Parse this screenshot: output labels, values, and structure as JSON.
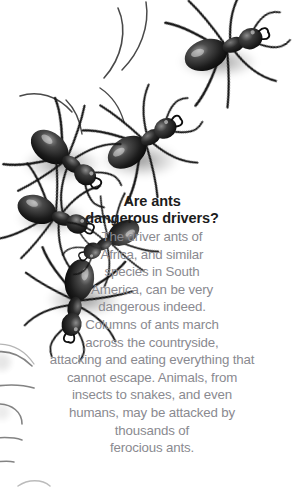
{
  "page": {
    "background_color": "#ffffff",
    "width": 301,
    "height": 501
  },
  "article": {
    "headline_color": "#1c1c1c",
    "body_color": "#8a8a90",
    "headline_lines": [
      "Are ants",
      "dangerous drivers?"
    ],
    "headline_full": "Are ants dangerous drivers?",
    "body_lines": [
      "The driver ants of",
      "Africa, and similar",
      "species in South",
      "America, can be very",
      "dangerous indeed.",
      "Columns of ants march",
      "across the countryside,",
      "attacking and eating everything that",
      "cannot escape. Animals, from",
      "insects to snakes, and even",
      "humans, may be attacked by",
      "thousands of",
      "ferocious ants."
    ],
    "body_full": "The driver ants of Africa, and similar species in South America, can be very dangerous indeed. Columns of ants march across the countryside, attacking and eating everything that cannot escape. Animals, from insects to snakes, and even humans, may be attacked by thousands of ferocious ants."
  },
  "illustration": {
    "subject": "black driver ants",
    "ant_body_color": "#141414",
    "ant_highlight_color": "#d8d8d8",
    "shadow_color": "#b4b4b4",
    "ants": [
      {
        "id": "ant-top-right",
        "cx": 214,
        "cy": 52,
        "scale": 1.05,
        "rotate": -20
      },
      {
        "id": "ant-upper-left",
        "cx": 56,
        "cy": 152,
        "scale": 1.0,
        "rotate": 38
      },
      {
        "id": "ant-upper-right",
        "cx": 134,
        "cy": 148,
        "scale": 1.0,
        "rotate": -32
      },
      {
        "id": "ant-mid-left",
        "cx": 46,
        "cy": 206,
        "scale": 0.95,
        "rotate": 22
      },
      {
        "id": "ant-lower-center",
        "cx": 78,
        "cy": 288,
        "scale": 1.0,
        "rotate": 8
      }
    ],
    "leg_fragments_left_edge": 6
  }
}
